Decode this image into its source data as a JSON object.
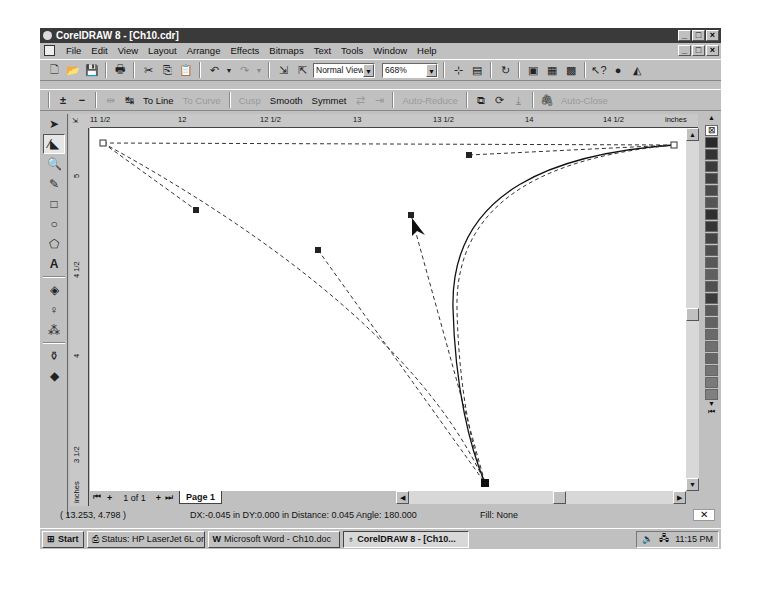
{
  "window": {
    "title": "CorelDRAW 8 - [Ch10.cdr]",
    "controls": [
      "_",
      "□",
      "×"
    ]
  },
  "menubar": {
    "items": [
      "File",
      "Edit",
      "View",
      "Layout",
      "Arrange",
      "Effects",
      "Bitmaps",
      "Text",
      "Tools",
      "Window",
      "Help"
    ]
  },
  "standard_toolbar": {
    "view_mode": "Normal View",
    "zoom_level": "668%",
    "icons": [
      "new-icon",
      "open-icon",
      "save-icon",
      "print-icon",
      "cut-icon",
      "copy-icon",
      "paste-icon",
      "undo-icon",
      "redo-icon",
      "import-icon",
      "export-icon",
      "snap-to-grid-icon",
      "snap-to-objects-icon",
      "refresh-icon",
      "application-launcher-icon",
      "corel-tutor-icon",
      "whats-this-icon",
      "corel-icon",
      "tips-icon"
    ]
  },
  "property_bar": {
    "buttons": [
      {
        "label": "To Line",
        "enabled": true
      },
      {
        "label": "To Curve",
        "enabled": false
      },
      {
        "label": "Cusp",
        "enabled": false
      },
      {
        "label": "Smooth",
        "enabled": true
      },
      {
        "label": "Symmet",
        "enabled": true
      },
      {
        "label": "Auto-Reduce",
        "enabled": false
      },
      {
        "label": "Auto-Close",
        "enabled": false
      }
    ]
  },
  "toolbox": {
    "tools": [
      "pick-tool",
      "shape-tool",
      "zoom-tool",
      "freehand-tool",
      "rectangle-tool",
      "ellipse-tool",
      "polygon-tool",
      "text-tool",
      "interactive-fill-tool",
      "interactive-transparency-tool",
      "interactive-blend-tool",
      "eyedropper-tool",
      "fill-tool"
    ],
    "active": "shape-tool"
  },
  "rulers": {
    "horizontal": [
      "11 1/2",
      "12",
      "12 1/2",
      "13",
      "13 1/2",
      "14",
      "14 1/2"
    ],
    "horizontal_unit": "inches",
    "vertical": [
      "5",
      "4 1/2",
      "4",
      "3 1/2"
    ],
    "vertical_unit": "inches"
  },
  "page_navigator": {
    "page_count": "1 of 1",
    "page_tab": "Page 1"
  },
  "status": {
    "coordinates": "( 13.253, 4.798 )",
    "info": "DX:-0.045 in DY:0.000 in Distance: 0.045 Angle: 180.000",
    "fill": "Fill: None"
  },
  "taskbar": {
    "start": "Start",
    "tasks": [
      {
        "label": "Status: HP LaserJet 6L on ...",
        "active": false
      },
      {
        "label": "Microsoft Word - Ch10.doc",
        "active": false
      },
      {
        "label": "CorelDRAW 8 - [Ch10...",
        "active": true
      }
    ],
    "clock": "11:15 PM"
  },
  "palette": {
    "swatches": [
      "#2a2a2a",
      "#333333",
      "#3a3a3a",
      "#404040",
      "#4a4a4a",
      "#555555",
      "#2e2e2e",
      "#363636",
      "#444444",
      "#4e4e4e",
      "#585858",
      "#606060",
      "#505050",
      "#3c3c3c",
      "#5a5a5a",
      "#626262",
      "#6a6a6a",
      "#707070",
      "#666666",
      "#747474",
      "#7a7a7a",
      "#808080"
    ]
  }
}
